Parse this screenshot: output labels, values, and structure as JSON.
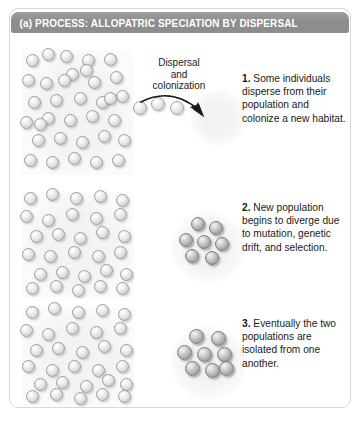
{
  "figure": {
    "header": {
      "label": "(a) PROCESS: ALLOPATRIC SPECIATION BY DISPERSAL",
      "bar_color": "#8d8d8d",
      "text_color": "#ffffff"
    },
    "frame_border_color": "#d8d8d8",
    "background_color": "#ffffff"
  },
  "annotations": {
    "dispersal_line1": "Dispersal",
    "dispersal_line2": "and",
    "dispersal_line3": "colonization"
  },
  "steps": [
    {
      "number": "1.",
      "text": " Some individuals disperse from their population and colonize a new habitat."
    },
    {
      "number": "2.",
      "text": " New population begins to diverge due to mutation, genetic drift, and selection."
    },
    {
      "number": "3.",
      "text": " Eventually the two populations are isolated from one another."
    }
  ],
  "colors": {
    "sphere_light_fill": "#dcdcdc",
    "sphere_light_stroke": "#9e9e9e",
    "sphere_dark_fill": "#b4b4b4",
    "sphere_dark_stroke": "#7c7c7c",
    "population_block_fill": "#f3f3f3",
    "arrow_color": "#1a1a1a"
  },
  "diagram_data": {
    "type": "diagram",
    "title": "(a) PROCESS: ALLOPATRIC SPECIATION BY DISPERSAL",
    "panel_count": 3,
    "populations": [
      {
        "panel": 1,
        "name": "source-population-1",
        "x": 22,
        "y": 50,
        "width": 112,
        "height": 125,
        "sphere_count": 34,
        "sphere_style": "light",
        "sphere_radius": 6.5,
        "points": [
          [
            10,
            10
          ],
          [
            26,
            4
          ],
          [
            44,
            6
          ],
          [
            66,
            10
          ],
          [
            88,
            9
          ],
          [
            6,
            30
          ],
          [
            24,
            33
          ],
          [
            50,
            24
          ],
          [
            72,
            32
          ],
          [
            94,
            27
          ],
          [
            12,
            52
          ],
          [
            34,
            50
          ],
          [
            58,
            48
          ],
          [
            80,
            52
          ],
          [
            100,
            46
          ],
          [
            4,
            72
          ],
          [
            26,
            68
          ],
          [
            48,
            70
          ],
          [
            70,
            66
          ],
          [
            92,
            70
          ],
          [
            16,
            90
          ],
          [
            38,
            88
          ],
          [
            60,
            92
          ],
          [
            82,
            86
          ],
          [
            102,
            90
          ],
          [
            8,
            110
          ],
          [
            30,
            112
          ],
          [
            52,
            108
          ],
          [
            74,
            112
          ],
          [
            96,
            110
          ],
          [
            42,
            30
          ],
          [
            88,
            48
          ],
          [
            18,
            74
          ],
          [
            64,
            20
          ]
        ]
      },
      {
        "panel": 2,
        "name": "source-population-2",
        "x": 22,
        "y": 192,
        "width": 112,
        "height": 105,
        "sphere_count": 30,
        "sphere_style": "light",
        "sphere_radius": 6.5,
        "points": [
          [
            8,
            6
          ],
          [
            30,
            2
          ],
          [
            54,
            6
          ],
          [
            78,
            4
          ],
          [
            100,
            8
          ],
          [
            4,
            24
          ],
          [
            26,
            28
          ],
          [
            50,
            22
          ],
          [
            74,
            26
          ],
          [
            98,
            22
          ],
          [
            14,
            44
          ],
          [
            36,
            42
          ],
          [
            58,
            46
          ],
          [
            80,
            40
          ],
          [
            102,
            44
          ],
          [
            6,
            62
          ],
          [
            28,
            64
          ],
          [
            52,
            60
          ],
          [
            76,
            64
          ],
          [
            98,
            60
          ],
          [
            18,
            82
          ],
          [
            40,
            80
          ],
          [
            62,
            84
          ],
          [
            84,
            78
          ],
          [
            104,
            82
          ],
          [
            10,
            96
          ],
          [
            34,
            94
          ],
          [
            56,
            98
          ],
          [
            78,
            94
          ],
          [
            100,
            96
          ]
        ]
      },
      {
        "panel": 3,
        "name": "source-population-3",
        "x": 22,
        "y": 308,
        "width": 112,
        "height": 98,
        "sphere_count": 30,
        "sphere_style": "light",
        "sphere_radius": 6.5,
        "points": [
          [
            10,
            4
          ],
          [
            32,
            0
          ],
          [
            56,
            4
          ],
          [
            80,
            2
          ],
          [
            102,
            6
          ],
          [
            4,
            22
          ],
          [
            26,
            26
          ],
          [
            50,
            20
          ],
          [
            74,
            24
          ],
          [
            98,
            20
          ],
          [
            14,
            42
          ],
          [
            36,
            40
          ],
          [
            60,
            44
          ],
          [
            82,
            38
          ],
          [
            104,
            42
          ],
          [
            6,
            58
          ],
          [
            30,
            62
          ],
          [
            52,
            58
          ],
          [
            76,
            62
          ],
          [
            100,
            58
          ],
          [
            18,
            76
          ],
          [
            40,
            74
          ],
          [
            64,
            78
          ],
          [
            86,
            72
          ],
          [
            104,
            76
          ],
          [
            10,
            88
          ],
          [
            34,
            86
          ],
          [
            58,
            90
          ],
          [
            80,
            86
          ],
          [
            102,
            88
          ]
        ]
      }
    ],
    "colonies": [
      {
        "panel": 2,
        "name": "founder-colony-diverging",
        "x": 182,
        "y": 222,
        "width": 50,
        "height": 48,
        "sphere_count": 7,
        "sphere_style": "dark",
        "sphere_radius": 7,
        "points": [
          [
            16,
            2
          ],
          [
            34,
            6
          ],
          [
            4,
            18
          ],
          [
            22,
            20
          ],
          [
            40,
            22
          ],
          [
            10,
            34
          ],
          [
            30,
            36
          ]
        ]
      },
      {
        "panel": 3,
        "name": "founder-colony-isolated",
        "x": 182,
        "y": 336,
        "width": 52,
        "height": 50,
        "sphere_count": 8,
        "sphere_style": "dark",
        "sphere_radius": 7.5,
        "points": [
          [
            14,
            0
          ],
          [
            36,
            2
          ],
          [
            2,
            16
          ],
          [
            22,
            18
          ],
          [
            42,
            18
          ],
          [
            10,
            32
          ],
          [
            30,
            34
          ],
          [
            44,
            32
          ]
        ]
      }
    ],
    "dispersing_individuals": {
      "name": "dispersing-individuals",
      "count": 3,
      "sphere_radius": 7,
      "points": [
        [
          140,
          108
        ],
        [
          158,
          104
        ],
        [
          177,
          108
        ]
      ]
    },
    "new_habitat": {
      "name": "new-habitat-area",
      "x": 190,
      "y": 90,
      "width": 56,
      "height": 56
    },
    "arrow": {
      "name": "dispersal-arrow",
      "from": [
        144,
        101
      ],
      "to": [
        204,
        116
      ],
      "style": "curved"
    }
  }
}
